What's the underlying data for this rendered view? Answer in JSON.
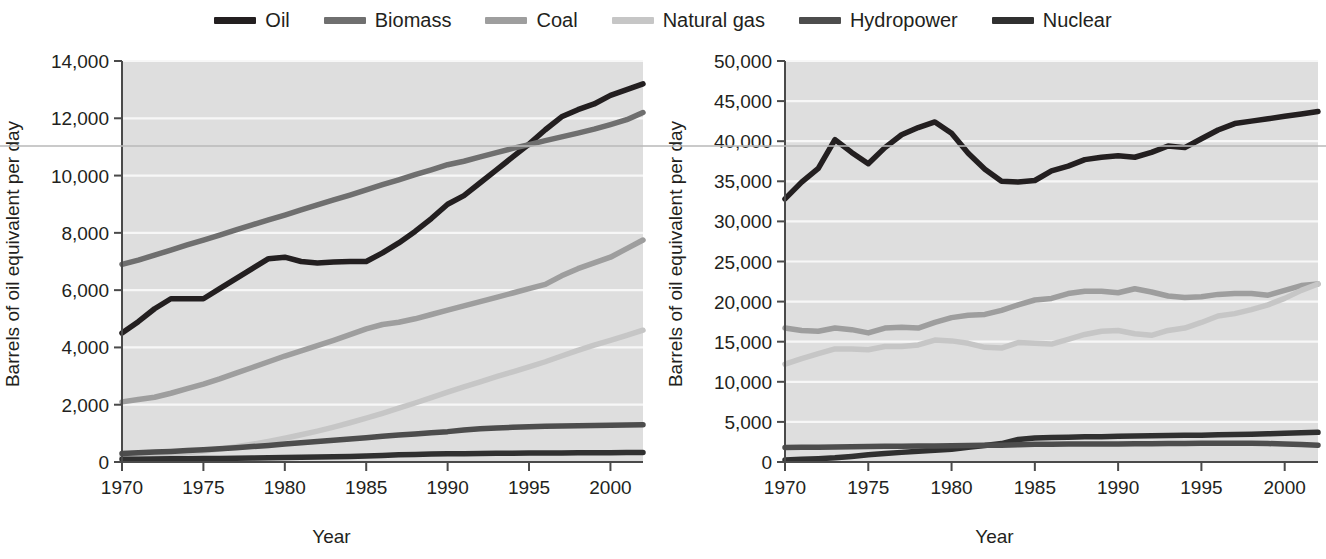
{
  "legend": {
    "items": [
      {
        "label": "Oil",
        "color": "#231f20",
        "icon": "legend-line-swatch"
      },
      {
        "label": "Biomass",
        "color": "#6f6f6f",
        "icon": "legend-line-swatch"
      },
      {
        "label": "Coal",
        "color": "#9e9e9e",
        "icon": "legend-line-swatch"
      },
      {
        "label": "Natural gas",
        "color": "#c6c6c6",
        "icon": "legend-line-swatch"
      },
      {
        "label": "Hydropower",
        "color": "#4d4d4d",
        "icon": "legend-line-swatch"
      },
      {
        "label": "Nuclear",
        "color": "#303030",
        "icon": "legend-line-swatch"
      }
    ]
  },
  "chart_data": [
    {
      "type": "line",
      "name": "developing-countries-energy",
      "title": "",
      "xlabel": "Year",
      "ylabel": "Barrels of oil equivalent per day",
      "xlim": [
        1970,
        2002
      ],
      "ylim": [
        0,
        14000
      ],
      "xticks": [
        1970,
        1975,
        1980,
        1985,
        1990,
        1995,
        2000
      ],
      "xtick_labels": [
        "1970",
        "1975",
        "1980",
        "1985",
        "1990",
        "1995",
        "2000"
      ],
      "yticks": [
        0,
        2000,
        4000,
        6000,
        8000,
        10000,
        12000,
        14000
      ],
      "ytick_labels": [
        "0",
        "2,000",
        "4,000",
        "6,000",
        "8,000",
        "10,000",
        "12,000",
        "14,000"
      ],
      "grid": true,
      "legend_position": "top-center-shared",
      "x": [
        1970,
        1971,
        1972,
        1973,
        1974,
        1975,
        1976,
        1977,
        1978,
        1979,
        1980,
        1981,
        1982,
        1983,
        1984,
        1985,
        1986,
        1987,
        1988,
        1989,
        1990,
        1991,
        1992,
        1993,
        1994,
        1995,
        1996,
        1997,
        1998,
        1999,
        2000,
        2001,
        2002
      ],
      "series": [
        {
          "name": "Oil",
          "color": "#231f20",
          "values": [
            4500,
            4900,
            5350,
            5700,
            5700,
            5700,
            6050,
            6400,
            6750,
            7100,
            7150,
            7000,
            6950,
            6980,
            7000,
            7000,
            7300,
            7650,
            8050,
            8500,
            9000,
            9300,
            9750,
            10200,
            10650,
            11100,
            11600,
            12050,
            12300,
            12500,
            12800,
            13000,
            13200
          ]
        },
        {
          "name": "Biomass",
          "color": "#6f6f6f",
          "values": [
            6900,
            7050,
            7220,
            7400,
            7580,
            7750,
            7920,
            8100,
            8280,
            8450,
            8620,
            8800,
            8980,
            9150,
            9320,
            9500,
            9680,
            9850,
            10030,
            10200,
            10380,
            10500,
            10650,
            10800,
            10950,
            11080,
            11220,
            11350,
            11480,
            11620,
            11780,
            11950,
            12200
          ]
        },
        {
          "name": "Coal",
          "color": "#9e9e9e",
          "values": [
            2100,
            2180,
            2260,
            2400,
            2560,
            2720,
            2900,
            3100,
            3300,
            3500,
            3700,
            3880,
            4060,
            4250,
            4450,
            4650,
            4800,
            4880,
            5000,
            5150,
            5300,
            5450,
            5600,
            5750,
            5900,
            6050,
            6200,
            6500,
            6750,
            6950,
            7150,
            7450,
            7750
          ]
        },
        {
          "name": "Natural gas",
          "color": "#c6c6c6",
          "values": [
            180,
            200,
            230,
            270,
            320,
            380,
            450,
            530,
            620,
            720,
            830,
            950,
            1080,
            1220,
            1370,
            1530,
            1700,
            1880,
            2060,
            2250,
            2440,
            2620,
            2800,
            2980,
            3150,
            3320,
            3500,
            3700,
            3900,
            4080,
            4250,
            4420,
            4600
          ]
        },
        {
          "name": "Hydropower",
          "color": "#4d4d4d",
          "values": [
            300,
            320,
            345,
            370,
            400,
            430,
            465,
            500,
            540,
            580,
            625,
            670,
            715,
            760,
            805,
            850,
            900,
            940,
            980,
            1020,
            1060,
            1120,
            1160,
            1190,
            1210,
            1230,
            1245,
            1255,
            1265,
            1275,
            1285,
            1292,
            1300
          ]
        },
        {
          "name": "Nuclear",
          "color": "#303030",
          "values": [
            95,
            100,
            105,
            110,
            115,
            120,
            125,
            132,
            140,
            148,
            155,
            163,
            172,
            180,
            190,
            210,
            230,
            250,
            265,
            275,
            285,
            292,
            298,
            302,
            306,
            310,
            314,
            318,
            320,
            322,
            325,
            328,
            330
          ]
        }
      ]
    },
    {
      "type": "line",
      "name": "industrialized-countries-energy",
      "title": "",
      "xlabel": "Year",
      "ylabel": "Barrels of oil equivalent per day",
      "xlim": [
        1970,
        2002
      ],
      "ylim": [
        0,
        50000
      ],
      "xticks": [
        1970,
        1975,
        1980,
        1985,
        1990,
        1995,
        2000
      ],
      "xtick_labels": [
        "1970",
        "1975",
        "1980",
        "1985",
        "1990",
        "1995",
        "2000"
      ],
      "yticks": [
        0,
        5000,
        10000,
        15000,
        20000,
        25000,
        30000,
        35000,
        40000,
        45000,
        50000
      ],
      "ytick_labels": [
        "0",
        "5,000",
        "10,000",
        "15,000",
        "20,000",
        "25,000",
        "30,000",
        "35,000",
        "40,000",
        "45,000",
        "50,000"
      ],
      "grid": true,
      "legend_position": "top-center-shared",
      "x": [
        1970,
        1971,
        1972,
        1973,
        1974,
        1975,
        1976,
        1977,
        1978,
        1979,
        1980,
        1981,
        1982,
        1983,
        1984,
        1985,
        1986,
        1987,
        1988,
        1989,
        1990,
        1991,
        1992,
        1993,
        1994,
        1995,
        1996,
        1997,
        1998,
        1999,
        2000,
        2001,
        2002
      ],
      "series": [
        {
          "name": "Oil",
          "color": "#231f20",
          "values": [
            32800,
            34900,
            36600,
            40200,
            38600,
            37200,
            39200,
            40800,
            41700,
            42400,
            41000,
            38500,
            36500,
            35000,
            34900,
            35100,
            36300,
            36900,
            37700,
            38000,
            38200,
            38000,
            38600,
            39400,
            39200,
            40300,
            41400,
            42200,
            42500,
            42800,
            43100,
            43400,
            43700
          ]
        },
        {
          "name": "Coal",
          "color": "#9e9e9e",
          "values": [
            16700,
            16400,
            16300,
            16700,
            16500,
            16100,
            16700,
            16800,
            16700,
            17400,
            18000,
            18300,
            18400,
            18900,
            19600,
            20200,
            20400,
            21000,
            21300,
            21300,
            21100,
            21600,
            21200,
            20700,
            20500,
            20600,
            20900,
            21000,
            21000,
            20800,
            21400,
            22000,
            22200
          ]
        },
        {
          "name": "Natural gas",
          "color": "#c6c6c6",
          "values": [
            12200,
            12900,
            13500,
            14100,
            14100,
            14000,
            14400,
            14400,
            14600,
            15200,
            15100,
            14800,
            14300,
            14200,
            14900,
            14800,
            14700,
            15300,
            15900,
            16300,
            16400,
            16000,
            15800,
            16400,
            16700,
            17400,
            18200,
            18500,
            19000,
            19600,
            20400,
            21400,
            22200
          ]
        },
        {
          "name": "Nuclear",
          "color": "#303030",
          "values": [
            250,
            330,
            420,
            520,
            700,
            900,
            1050,
            1200,
            1350,
            1450,
            1600,
            1850,
            2050,
            2300,
            2800,
            3000,
            3050,
            3100,
            3150,
            3150,
            3200,
            3250,
            3280,
            3300,
            3320,
            3350,
            3400,
            3430,
            3470,
            3520,
            3580,
            3640,
            3700
          ]
        },
        {
          "name": "Hydropower",
          "color": "#4d4d4d",
          "values": [
            1800,
            1830,
            1850,
            1880,
            1900,
            1930,
            1950,
            1950,
            1980,
            2000,
            2030,
            2050,
            2080,
            2100,
            2150,
            2200,
            2220,
            2230,
            2240,
            2230,
            2250,
            2280,
            2260,
            2300,
            2320,
            2340,
            2350,
            2340,
            2330,
            2300,
            2250,
            2180,
            2100
          ]
        }
      ]
    }
  ]
}
